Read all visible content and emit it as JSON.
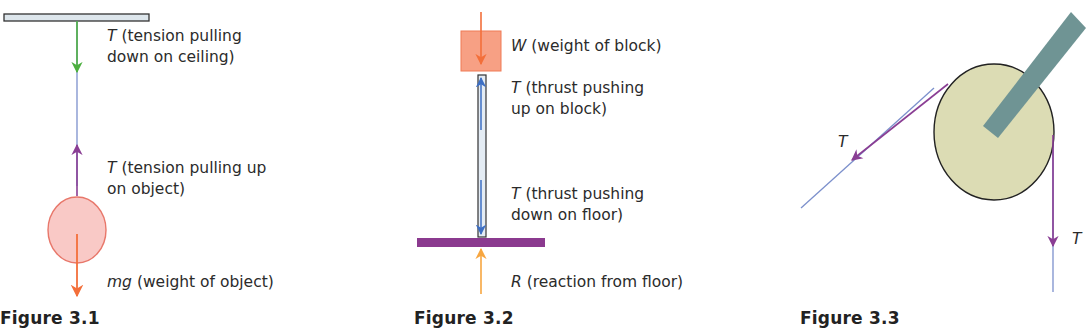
{
  "figures": [
    {
      "caption": "Figure 3.1",
      "labels": [
        {
          "symbol": "T",
          "line1": " (tension pulling",
          "line2": "down on ceiling)"
        },
        {
          "symbol": "T",
          "line1": " (tension pulling up",
          "line2": "on object)"
        },
        {
          "symbol": "mg",
          "line1": " (weight of object)"
        }
      ]
    },
    {
      "caption": "Figure 3.2",
      "labels": [
        {
          "symbol": "W",
          "line1": " (weight of block)"
        },
        {
          "symbol": "T",
          "line1": " (thrust pushing",
          "line2": "up on block)"
        },
        {
          "symbol": "T",
          "line1": " (thrust pushing",
          "line2": "down on floor)"
        },
        {
          "symbol": "R",
          "line1": " (reaction from floor)"
        }
      ]
    },
    {
      "caption": "Figure 3.3",
      "labels": [
        {
          "symbol": "T"
        },
        {
          "symbol": "T"
        }
      ]
    }
  ],
  "colors": {
    "ceiling_fill": "#dde6ec",
    "green_arrow": "#4caf3f",
    "purple_arrow": "#8a3e94",
    "orange_arrow": "#f36f3a",
    "light_orange_arrow": "#f7a640",
    "blue_arrow": "#3d6fc4",
    "string_blue": "#6f8fd6",
    "object_fill": "#f9c9c6",
    "object_stroke": "#e8776a",
    "block_fill": "#f7a084",
    "floor_purple": "#8b3a8f",
    "pulley_fill": "#dcdcb4",
    "bracket": "#6f9494"
  }
}
